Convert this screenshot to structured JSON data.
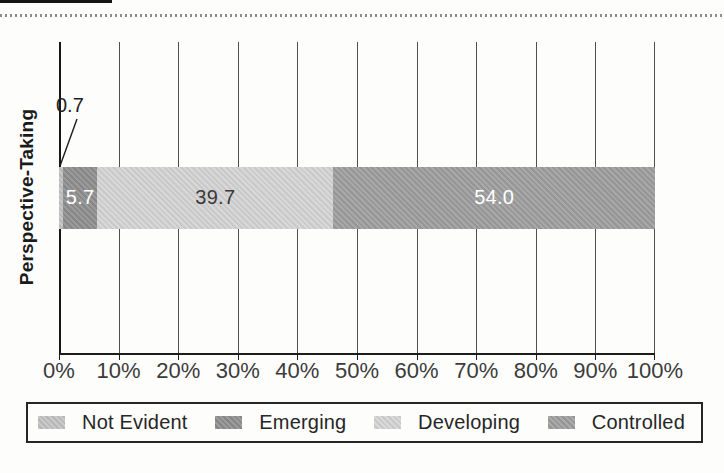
{
  "chart_data": {
    "type": "bar",
    "variant": "horizontal-stacked",
    "title": "",
    "xlabel": "",
    "ylabel": "Perspective-Taking",
    "categories": [
      "Perspective-Taking"
    ],
    "series": [
      {
        "name": "Not Evident",
        "value": 0.7,
        "label": "0.7",
        "color": "#c2c2c2",
        "label_color": "#1f1f1f",
        "label_placement": "callout"
      },
      {
        "name": "Emerging",
        "value": 5.7,
        "label": "5.7",
        "color": "#8e8e8e",
        "label_color": "#ffffff",
        "label_placement": "inside"
      },
      {
        "name": "Developing",
        "value": 39.7,
        "label": "39.7",
        "color": "#d4d4d4",
        "label_color": "#3a3a3a",
        "label_placement": "inside"
      },
      {
        "name": "Controlled",
        "value": 54.0,
        "label": "54.0",
        "color": "#9e9e9e",
        "label_color": "#ffffff",
        "label_placement": "inside"
      }
    ],
    "x_ticks": [
      "0%",
      "10%",
      "20%",
      "30%",
      "40%",
      "50%",
      "60%",
      "70%",
      "80%",
      "90%",
      "100%"
    ],
    "xlim": [
      0,
      100
    ],
    "grid": "vertical-gridlines",
    "legend_position": "bottom-boxed"
  }
}
